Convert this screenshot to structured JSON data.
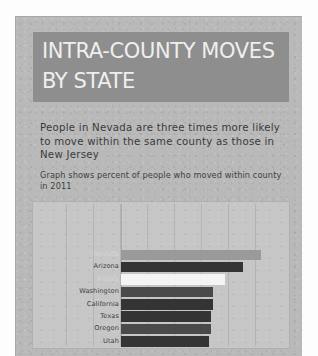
{
  "card": {
    "title_lines": [
      "INTRA-COUNTY MOVES",
      "BY STATE"
    ],
    "headline": "People in Nevada are three times more likely to move within the same county as those in New Jersey",
    "caption": "Graph shows percent of people who moved within county in 2011"
  },
  "colors": {
    "card_background": "#b9b9b9",
    "title_banner": "#8e8e8e",
    "title_text": "#efefef",
    "plot_background": "#c6c6c6",
    "bar_dark": "#343434",
    "bar_light": "#9a9a9a",
    "bar_highlight": "#f4f4f4",
    "gridline": "#b3b3b3"
  },
  "chart_data": {
    "type": "bar",
    "orientation": "horizontal",
    "title": "INTRA-COUNTY MOVES BY STATE",
    "subtitle": "Graph shows percent of people who moved within county in 2011",
    "xlabel": "",
    "ylabel": "",
    "xlim": [
      0,
      12
    ],
    "grid": true,
    "legend": false,
    "categories": [
      "Nevada",
      "Arizona",
      "Alaska",
      "Washington",
      "California",
      "Texas",
      "Oregon",
      "Utah"
    ],
    "values": [
      10.4,
      9.0,
      7.7,
      6.8,
      6.8,
      6.7,
      6.7,
      6.5
    ],
    "bar_styles": [
      "light",
      "dark",
      "highlight",
      "mid",
      "dark",
      "dark",
      "mid",
      "dark"
    ],
    "label_styles": [
      "faint",
      "normal",
      "faint",
      "normal",
      "normal",
      "normal",
      "normal",
      "normal"
    ],
    "gridline_count": 8
  }
}
